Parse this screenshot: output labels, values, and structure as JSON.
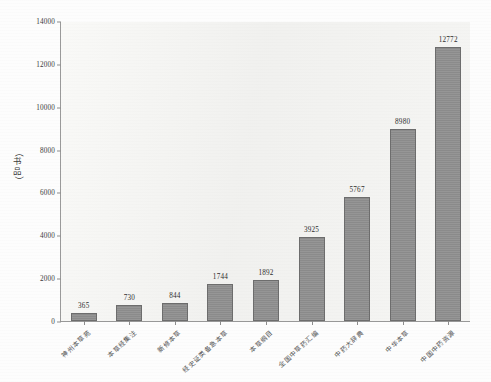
{
  "chart_data": {
    "type": "bar",
    "title": "",
    "xlabel": "",
    "ylabel": "（书品）",
    "ylabel_chars": [
      "书",
      "品"
    ],
    "ylim": [
      0,
      14000
    ],
    "ytick_step": 2000,
    "yticks": [
      "0",
      "2000",
      "4000",
      "6000",
      "8000",
      "10000",
      "12000",
      "14000"
    ],
    "ytick_values": [
      0,
      2000,
      4000,
      6000,
      8000,
      10000,
      12000,
      14000
    ],
    "grid": false,
    "legend": "none",
    "bar_color": "#8e8e8e",
    "bar_edge_color": "#6d6d6d",
    "plot_bg_color": "#f2f2f0",
    "axis_color": "#9a9a9a",
    "text_color": "#3b3b3b",
    "categories": [
      "神州本草苑",
      "本草经集注",
      "新修本草",
      "经史证类备急本草",
      "本草纲目",
      "全国中草药汇编",
      "中药大辞典",
      "中华本草",
      "中国中药资源"
    ],
    "values": [
      365,
      730,
      844,
      1744,
      1892,
      3925,
      5767,
      8980,
      12772
    ],
    "value_labels": [
      "365",
      "730",
      "844",
      "1744",
      "1892",
      "3925",
      "5767",
      "8980",
      "12772"
    ]
  }
}
